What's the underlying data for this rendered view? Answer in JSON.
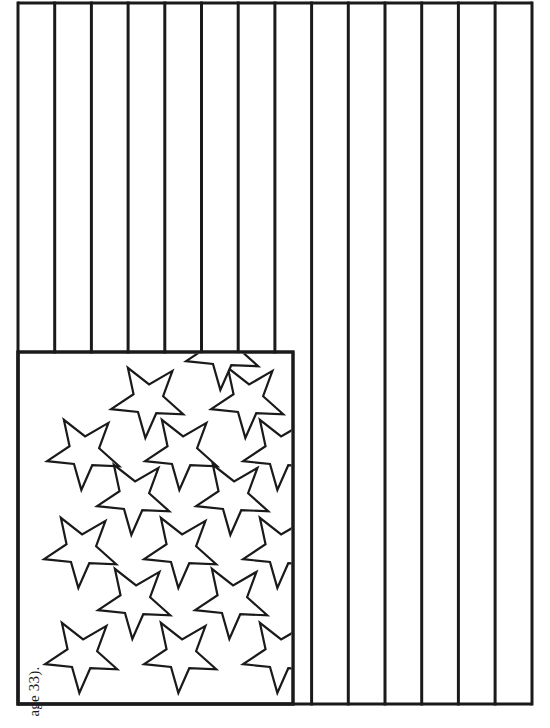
{
  "page": {
    "background_color": "#ffffff",
    "ink_color": "#1a1a1a",
    "width": 550,
    "height": 728,
    "rotation_note": "page content rotated 90 degrees; stripes render vertically"
  },
  "margin_note": {
    "text": "age 33).",
    "full_text_guess": "(page 33)."
  },
  "flag": {
    "name": "united-states-flag-outline",
    "outline_color": "#1a1a1a",
    "fill_color": "#ffffff",
    "stroke_width": 3,
    "bounds": {
      "x": 18,
      "y": 3,
      "width": 514,
      "height": 701
    },
    "stripes": {
      "count": 14,
      "orientation": "vertical",
      "line_positions_x": [
        18,
        54.7,
        91.4,
        128.1,
        164.8,
        201.5,
        238.2,
        274.9,
        311.6,
        348.3,
        385,
        421.7,
        458.4,
        495.1,
        532
      ],
      "short_stripe_stop_y": 352,
      "short_stripe_count": 8
    },
    "canton": {
      "name": "star-field",
      "bounds": {
        "x": 18,
        "y": 352,
        "width": 275,
        "height": 352
      },
      "star_count": 16,
      "star_outer_radius": 38,
      "star_inner_ratio": 0.41,
      "star_rotation_deg": -104,
      "stars": [
        {
          "cx": 130,
          "cy": 400
        },
        {
          "cx": 230,
          "cy": 400
        },
        {
          "cx": 66,
          "cy": 452
        },
        {
          "cx": 164,
          "cy": 452
        },
        {
          "cx": 262,
          "cy": 452
        },
        {
          "cx": 116,
          "cy": 497
        },
        {
          "cx": 215,
          "cy": 497
        },
        {
          "cx": 63,
          "cy": 550
        },
        {
          "cx": 163,
          "cy": 550
        },
        {
          "cx": 262,
          "cy": 550
        },
        {
          "cx": 117,
          "cy": 601
        },
        {
          "cx": 214,
          "cy": 601
        },
        {
          "cx": 64,
          "cy": 655
        },
        {
          "cx": 163,
          "cy": 655
        },
        {
          "cx": 262,
          "cy": 655
        },
        {
          "cx": 205,
          "cy": 352
        }
      ]
    }
  }
}
